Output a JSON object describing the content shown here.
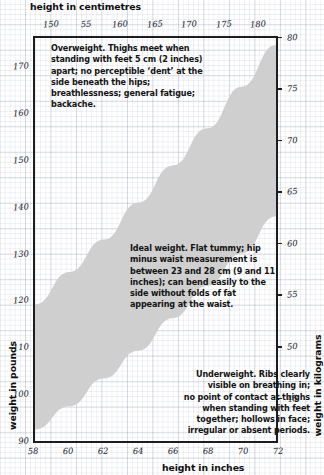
{
  "axes": {
    "top_title": "height in centimetres",
    "bottom_title": "height in inches",
    "left_title": "weight in pounds",
    "right_title": "weight in kilograms",
    "top_ticks": [
      "150",
      "55",
      "160",
      "165",
      "170",
      "175",
      "180"
    ],
    "bottom_ticks": [
      "58",
      "60",
      "62",
      "64",
      "66",
      "68",
      "70",
      "72"
    ],
    "left_ticks": [
      "170",
      "160",
      "150",
      "140",
      "130",
      "120",
      "110",
      "100",
      "90"
    ],
    "right_ticks": [
      "80",
      "75",
      "70",
      "65",
      "60",
      "55",
      "50",
      "45"
    ]
  },
  "notes": {
    "overweight": "Overweight. Thighs meet when standing with feet 5 cm (2 inches) apart; no perceptible ‘dent’ at the side beneath the hips; breathlessness; general fatigue; backache.",
    "ideal": "Ideal weight. Flat tummy; hip minus waist measurement is between 23 and 28 cm (9 and 11 inches); can bend easily to the side without folds of fat appearing at the waist.",
    "underweight_lines": [
      "Underweight. Ribs clearly",
      "visible on breathing in;",
      "no point of contact at thighs",
      "when standing with feet",
      "together; hollows in face;",
      "irregular or absent periods."
    ]
  },
  "colors": {
    "band_fill": "#cfcfcf",
    "frame": "#1d1d1d",
    "grid": "#96a0b4",
    "text": "#131313",
    "page_background": "#ffffff"
  },
  "chart_data": {
    "type": "area",
    "xlabel": "height in inches",
    "ylabel": "weight in pounds",
    "x2label": "height in centimetres",
    "y2label": "weight in kilograms",
    "xlim": [
      58,
      72
    ],
    "ylim": [
      90,
      175
    ],
    "x2lim": [
      147.3,
      182.9
    ],
    "y2lim": [
      40.8,
      79.4
    ],
    "xticks": [
      58,
      60,
      62,
      64,
      66,
      68,
      70,
      72
    ],
    "yticks": [
      90,
      100,
      110,
      120,
      130,
      140,
      150,
      160,
      170
    ],
    "x2ticks": [
      150,
      155,
      160,
      165,
      170,
      175,
      180
    ],
    "y2ticks": [
      45,
      50,
      55,
      60,
      65,
      70,
      75,
      80
    ],
    "grid": true,
    "legend": "none",
    "series": [
      {
        "name": "ideal weight band – upper limit",
        "x": [
          58,
          60,
          62,
          64,
          66,
          68,
          70,
          72
        ],
        "y": [
          119,
          126,
          133,
          141,
          149,
          157,
          166,
          175
        ]
      },
      {
        "name": "ideal weight band – lower limit",
        "x": [
          58,
          60,
          62,
          64,
          66,
          68,
          70,
          72
        ],
        "y": [
          92,
          97,
          103,
          109,
          116,
          123,
          130,
          138
        ]
      }
    ],
    "regions": [
      {
        "name": "Overweight",
        "position": "above band"
      },
      {
        "name": "Ideal weight",
        "position": "inside shaded band"
      },
      {
        "name": "Underweight",
        "position": "below band"
      }
    ]
  }
}
